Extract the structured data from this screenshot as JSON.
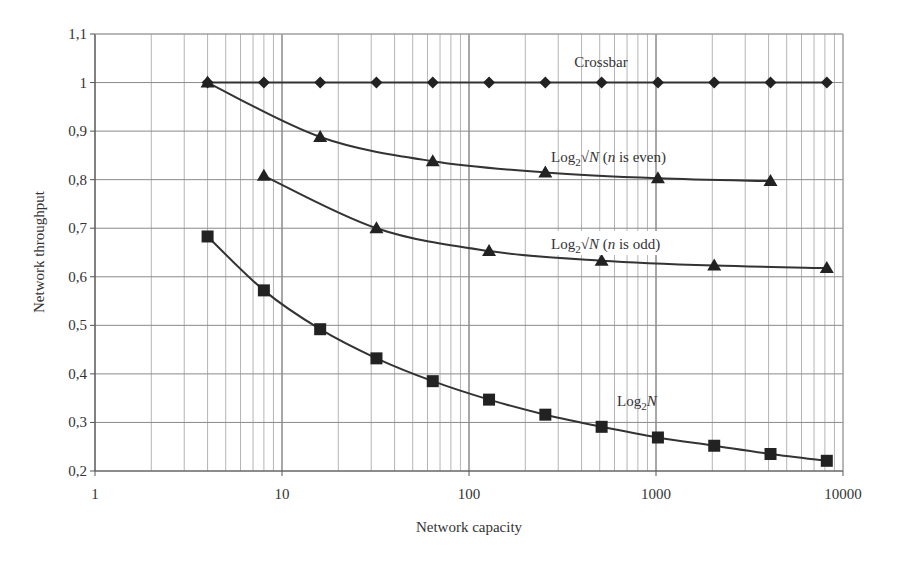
{
  "chart_data": {
    "type": "line",
    "title": "",
    "xlabel": "Network capacity",
    "ylabel": "Network throughput",
    "xscale": "log",
    "xlim": [
      1,
      10000
    ],
    "ylim": [
      0.2,
      1.1
    ],
    "x_ticks": [
      "1",
      "10",
      "100",
      "1000",
      "10000"
    ],
    "y_ticks": [
      "0,2",
      "0,3",
      "0,4",
      "0,5",
      "0,6",
      "0,7",
      "0,8",
      "0,9",
      "1",
      "1,1"
    ],
    "grid": true,
    "legend": "inline labels",
    "series": [
      {
        "name": "Crossbar",
        "marker": "diamond",
        "x": [
          4,
          8,
          16,
          32,
          64,
          128,
          256,
          512,
          1024,
          2048,
          4096,
          8192
        ],
        "values": [
          1,
          1,
          1,
          1,
          1,
          1,
          1,
          1,
          1,
          1,
          1,
          1
        ],
        "label_pos": [
          601,
          67
        ]
      },
      {
        "name": "Log2√N (n is even)",
        "marker": "triangle",
        "x": [
          4,
          16,
          64,
          256,
          1024,
          4096
        ],
        "values": [
          1.0,
          0.888,
          0.838,
          0.815,
          0.803,
          0.797
        ],
        "label_pos": [
          551,
          162
        ]
      },
      {
        "name": "Log2√N (n is odd)",
        "marker": "triangle",
        "x": [
          8,
          32,
          128,
          512,
          2048,
          8192
        ],
        "values": [
          0.808,
          0.7,
          0.653,
          0.633,
          0.623,
          0.618
        ],
        "label_pos": [
          551,
          249
        ]
      },
      {
        "name": "Log2N",
        "marker": "square",
        "x": [
          4,
          8,
          16,
          32,
          64,
          128,
          256,
          512,
          1024,
          2048,
          4096,
          8192
        ],
        "values": [
          0.683,
          0.572,
          0.492,
          0.432,
          0.385,
          0.347,
          0.316,
          0.291,
          0.269,
          0.252,
          0.235,
          0.221
        ],
        "label_pos": [
          617,
          406
        ]
      }
    ]
  },
  "labels": {
    "crossbar": "Crossbar",
    "even_prefix": "Log",
    "even_sub": "2",
    "even_sqrt": "√",
    "even_var": "N",
    "even_paren_open": " (",
    "even_n": "n",
    "even_rest": " is even)",
    "odd_rest": " is odd)",
    "log2n_prefix": "Log",
    "log2n_sub": "2",
    "log2n_var": "N",
    "xlabel": "Network capacity",
    "ylabel": "Network throughput"
  }
}
